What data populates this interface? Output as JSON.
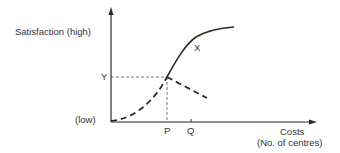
{
  "diagram": {
    "y_axis": {
      "label_high": "Satisfaction (high)",
      "label_low": "(low)",
      "marker": "Y"
    },
    "x_axis": {
      "label_line1": "Costs",
      "label_line2": "(No. of centres)",
      "markers": [
        "P",
        "Q"
      ]
    },
    "curve_label": "X",
    "colors": {
      "line": "#2a2a2a",
      "guide": "#555555"
    }
  }
}
